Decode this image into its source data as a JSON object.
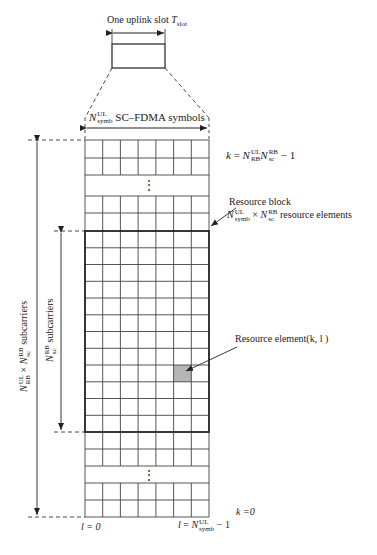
{
  "diagram": {
    "slot_label": "One uplink slot",
    "slot_symbol": "T",
    "slot_symbol_sub": "slot",
    "symbols_label": {
      "N": "N",
      "sup": "UL",
      "sub": "symb",
      "text": "SC–FDMA symbols"
    },
    "top_index_label": {
      "k": "k",
      "eq": "=",
      "n1": "N",
      "n1_sup": "UL",
      "n1_sub": "RB",
      "n2": "N",
      "n2_sup": "RB",
      "n2_sub": "sc",
      "tail": "− 1"
    },
    "resource_block_label": {
      "title": "Resource block",
      "n1": "N",
      "n1_sup": "UL",
      "n1_sub": "symb",
      "times": "×",
      "n2": "N",
      "n2_sup": "RB",
      "n2_sub": "sc",
      "text": "resource elements"
    },
    "resource_element_label": "Resource element(k, l )",
    "total_subcarriers_label": {
      "n1": "N",
      "n1_sup": "UL",
      "n1_sub": "RB",
      "times": "×",
      "n2": "N",
      "n2_sup": "RB",
      "n2_sub": "sc",
      "text": "subcarriers"
    },
    "rb_subcarriers_label": {
      "n": "N",
      "sup": "RB",
      "sub": "sc",
      "text": "subcarriers"
    },
    "bottom_index_label": "k =0",
    "l_start_label": "l = 0",
    "l_end_label": {
      "l": "l",
      "eq": "=",
      "n": "N",
      "sup": "UL",
      "sub": "symb",
      "tail": "− 1"
    },
    "ellipsis": "⋮",
    "grid": {
      "columns": 7,
      "rb_rows": 12,
      "shaded_cell": {
        "row_in_rb": 9,
        "column": 6
      },
      "shade_color": "#b5b5b5",
      "line_color": "#333333"
    }
  }
}
